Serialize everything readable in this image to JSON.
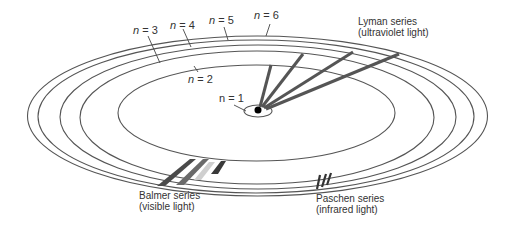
{
  "diagram": {
    "levels": [
      {
        "label": "n = 1",
        "n": "n",
        "eq": " = 1"
      },
      {
        "label": "n = 2",
        "n": "n",
        "eq": " = 2"
      },
      {
        "label": "n = 3",
        "n": "n",
        "eq": " = 3"
      },
      {
        "label": "n = 4",
        "n": "n",
        "eq": " = 4"
      },
      {
        "label": "n = 5",
        "n": "n",
        "eq": " = 5"
      },
      {
        "label": "n = 6",
        "n": "n",
        "eq": " = 6"
      }
    ],
    "series": [
      {
        "name": "Lyman series",
        "note": "(ultraviolet light)"
      },
      {
        "name": "Balmer series",
        "note": "(visible light)"
      },
      {
        "name": "Paschen series",
        "note": "(infrared light)"
      }
    ]
  }
}
